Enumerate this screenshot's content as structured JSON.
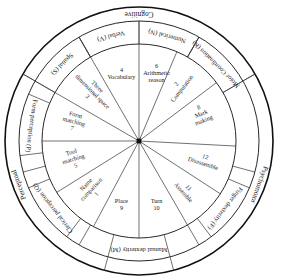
{
  "diagram": {
    "center": {
      "x": 139,
      "y": 141
    },
    "radii": {
      "outer": 134,
      "middle": 120,
      "inner": 97
    },
    "colors": {
      "stroke": "#111111",
      "text": "#1a1a1a",
      "background": "#ffffff"
    }
  },
  "outer_ring": [
    {
      "label": "Cognitive",
      "start_deg": 30,
      "end_deg": 150,
      "mid_deg": 90
    },
    {
      "label": "Perceptual",
      "start_deg": 150,
      "end_deg": 255,
      "mid_deg": 200
    },
    {
      "label": "Psychomotor",
      "start_deg": 285,
      "end_deg": 30,
      "mid_deg": 340
    }
  ],
  "middle_ring": [
    {
      "label": "Verbal (V)",
      "mid_deg": 105
    },
    {
      "label": "Numerical (N)",
      "mid_deg": 75
    },
    {
      "label": "Spatial (S)",
      "mid_deg": 135
    },
    {
      "label": "Form perception (P)",
      "mid_deg": 172
    },
    {
      "label": "Clerical perception (Q)",
      "mid_deg": 218
    },
    {
      "label": "Manual dexterity (M)",
      "mid_deg": 270
    },
    {
      "label": "Finger dexterity (F)",
      "mid_deg": 322
    },
    {
      "label": "Motor Coordination (K)",
      "mid_deg": 45
    }
  ],
  "segments": [
    {
      "number": "4",
      "label": "Vocabulary",
      "mid_deg": 105
    },
    {
      "number": "6",
      "label": "Arithmetic reason",
      "mid_deg": 75
    },
    {
      "number": "2",
      "label": "Computation",
      "mid_deg": 52
    },
    {
      "number": "8",
      "label": "Mark making",
      "mid_deg": 22
    },
    {
      "number": "12",
      "label": "Disassemble",
      "mid_deg": -18
    },
    {
      "number": "11",
      "label": "Assemble",
      "mid_deg": -48
    },
    {
      "number": "10",
      "label": "Turn",
      "mid_deg": -75
    },
    {
      "number": "9",
      "label": "Place",
      "mid_deg": -105
    },
    {
      "number": "1",
      "label": "Name comparison",
      "mid_deg": -133
    },
    {
      "number": "5",
      "label": "Tool matching",
      "mid_deg": -163
    },
    {
      "number": "7",
      "label": "Form matching",
      "mid_deg": 165
    },
    {
      "number": "3",
      "label": "Three dimensional space",
      "mid_deg": 135
    }
  ]
}
